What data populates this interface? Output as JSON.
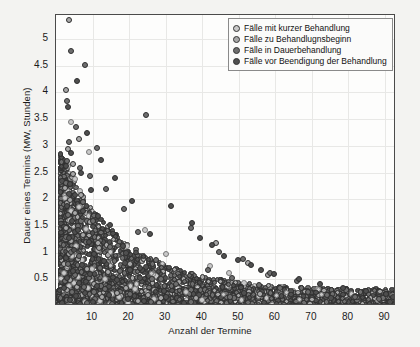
{
  "chart_data": {
    "type": "scatter",
    "title": "",
    "xlabel": "Anzahl der Termine",
    "ylabel": "Dauer eines Termins (MW, Stunden)",
    "xlim": [
      0,
      93
    ],
    "ylim": [
      0,
      5.45
    ],
    "xticks": [
      10,
      20,
      30,
      40,
      50,
      60,
      70,
      80,
      90
    ],
    "xticklabels": [
      "10",
      "20",
      "30",
      "40",
      "50",
      "60",
      "70",
      "80",
      "90"
    ],
    "yticks": [
      0.5,
      1,
      1.5,
      2,
      2.5,
      3,
      3.5,
      4,
      4.5,
      5
    ],
    "yticklabels": [
      "0.5",
      "1",
      "1.5",
      "2",
      "2.5",
      "3",
      "3.5",
      "4",
      "4.5",
      "5"
    ],
    "grid": true,
    "legend_position": "upper right",
    "marker_colors": {
      "short": "#c9c9c9",
      "begin": "#a8a8a8",
      "ongoing": "#6e6e6e",
      "ending": "#4f4f4f"
    },
    "series": [
      {
        "name": "Fälle mit kurzer Behandlung",
        "color": "#c9c9c9",
        "points": [
          [
            4.0,
            3.45
          ],
          [
            3.2,
            2.62
          ],
          [
            5.1,
            2.38
          ],
          [
            2.4,
            2.02
          ],
          [
            6.3,
            1.86
          ],
          [
            3.9,
            1.62
          ],
          [
            8.1,
            1.44
          ],
          [
            2.7,
            1.27
          ],
          [
            5.6,
            1.12
          ],
          [
            11.4,
            1.05
          ],
          [
            4.4,
            0.93
          ],
          [
            7.2,
            0.86
          ],
          [
            3.1,
            0.74
          ],
          [
            9.8,
            0.69
          ],
          [
            2.2,
            0.61
          ],
          [
            6.0,
            0.55
          ],
          [
            13.5,
            0.5
          ],
          [
            4.8,
            0.44
          ],
          [
            3.6,
            0.38
          ],
          [
            8.7,
            0.33
          ],
          [
            2.9,
            0.28
          ],
          [
            15.2,
            0.22
          ],
          [
            5.4,
            0.18
          ],
          [
            10.6,
            0.14
          ],
          [
            3.4,
            0.1
          ],
          [
            7.8,
            0.07
          ],
          [
            19.6,
            0.05
          ],
          [
            12.1,
            0.09
          ],
          [
            24.4,
            1.42
          ],
          [
            30.2,
            0.98
          ],
          [
            42.1,
            0.74
          ],
          [
            47.3,
            0.62
          ],
          [
            21.7,
            0.31
          ],
          [
            35.6,
            0.26
          ],
          [
            14.9,
            0.04
          ],
          [
            17.3,
            0.16
          ],
          [
            26.8,
            0.13
          ],
          [
            9.1,
            2.88
          ],
          [
            6.6,
            2.15
          ],
          [
            4.2,
            1.78
          ]
        ]
      },
      {
        "name": "Fälle zu Behandlugnsbeginn",
        "color": "#a8a8a8",
        "points": [
          [
            3.6,
            5.35
          ],
          [
            2.8,
            4.05
          ],
          [
            3.3,
            2.94
          ],
          [
            4.6,
            2.47
          ],
          [
            2.5,
            2.21
          ],
          [
            6.8,
            2.08
          ],
          [
            3.0,
            1.92
          ],
          [
            5.2,
            1.74
          ],
          [
            9.3,
            1.58
          ],
          [
            2.6,
            1.46
          ],
          [
            7.4,
            1.33
          ],
          [
            4.1,
            1.21
          ],
          [
            11.8,
            1.09
          ],
          [
            3.5,
            0.97
          ],
          [
            6.1,
            0.88
          ],
          [
            2.3,
            0.79
          ],
          [
            8.5,
            0.7
          ],
          [
            14.2,
            0.63
          ],
          [
            4.9,
            0.56
          ],
          [
            3.8,
            0.48
          ],
          [
            10.4,
            0.42
          ],
          [
            5.7,
            0.36
          ],
          [
            2.9,
            0.3
          ],
          [
            16.8,
            0.25
          ],
          [
            7.0,
            0.2
          ],
          [
            12.6,
            0.16
          ],
          [
            4.3,
            0.12
          ],
          [
            22.5,
            0.09
          ],
          [
            9.6,
            0.06
          ],
          [
            28.1,
            0.05
          ],
          [
            33.7,
            0.45
          ],
          [
            52.4,
            0.8
          ],
          [
            57.9,
            0.58
          ],
          [
            43.8,
            1.18
          ],
          [
            19.1,
            0.33
          ],
          [
            25.3,
            0.21
          ],
          [
            38.2,
            0.15
          ],
          [
            6.4,
            3.12
          ],
          [
            4.7,
            2.66
          ],
          [
            3.9,
            1.99
          ]
        ]
      },
      {
        "name": "Fälle in Dauerbehandlung",
        "color": "#6e6e6e",
        "points": [
          [
            4.2,
            4.78
          ],
          [
            7.9,
            4.52
          ],
          [
            2.9,
            3.84
          ],
          [
            5.4,
            3.36
          ],
          [
            3.6,
            3.08
          ],
          [
            11.2,
            2.96
          ],
          [
            24.6,
            3.58
          ],
          [
            3.1,
            2.72
          ],
          [
            6.7,
            2.58
          ],
          [
            9.4,
            2.44
          ],
          [
            2.6,
            2.31
          ],
          [
            13.8,
            2.19
          ],
          [
            4.8,
            2.06
          ],
          [
            7.3,
            1.94
          ],
          [
            18.5,
            1.82
          ],
          [
            3.4,
            1.71
          ],
          [
            10.1,
            1.6
          ],
          [
            5.9,
            1.49
          ],
          [
            22.3,
            1.39
          ],
          [
            2.8,
            1.29
          ],
          [
            8.2,
            1.2
          ],
          [
            14.7,
            1.11
          ],
          [
            4.1,
            1.02
          ],
          [
            6.3,
            0.94
          ],
          [
            27.4,
            0.86
          ],
          [
            3.2,
            0.79
          ],
          [
            11.9,
            0.72
          ],
          [
            17.6,
            0.65
          ],
          [
            5.1,
            0.58
          ],
          [
            9.0,
            0.52
          ],
          [
            2.4,
            0.46
          ],
          [
            32.8,
            0.41
          ],
          [
            7.6,
            0.36
          ],
          [
            13.4,
            0.31
          ],
          [
            4.5,
            0.26
          ],
          [
            20.2,
            0.22
          ],
          [
            6.0,
            0.18
          ],
          [
            10.8,
            0.14
          ],
          [
            3.0,
            0.11
          ],
          [
            26.1,
            0.08
          ],
          [
            8.4,
            0.06
          ],
          [
            15.3,
            0.04
          ],
          [
            41.5,
            0.68
          ],
          [
            48.2,
            0.52
          ],
          [
            55.6,
            0.4
          ],
          [
            61.3,
            0.33
          ],
          [
            68.9,
            0.27
          ],
          [
            74.2,
            0.21
          ],
          [
            81.7,
            0.17
          ],
          [
            88.4,
            0.13
          ],
          [
            36.9,
            1.46
          ],
          [
            44.7,
            1.02
          ],
          [
            51.1,
            0.88
          ],
          [
            58.5,
            0.62
          ],
          [
            65.8,
            0.46
          ]
        ]
      },
      {
        "name": "Fälle vor Beendigung der Behandlung",
        "color": "#4f4f4f",
        "points": [
          [
            5.8,
            4.22
          ],
          [
            3.3,
            3.72
          ],
          [
            8.6,
            3.24
          ],
          [
            4.0,
            2.86
          ],
          [
            12.4,
            2.74
          ],
          [
            2.7,
            2.62
          ],
          [
            6.9,
            2.5
          ],
          [
            16.1,
            2.4
          ],
          [
            3.8,
            2.28
          ],
          [
            9.7,
            2.17
          ],
          [
            5.2,
            2.07
          ],
          [
            20.8,
            1.97
          ],
          [
            2.9,
            1.88
          ],
          [
            7.5,
            1.78
          ],
          [
            11.6,
            1.69
          ],
          [
            4.3,
            1.6
          ],
          [
            14.9,
            1.52
          ],
          [
            6.1,
            1.43
          ],
          [
            25.7,
            1.35
          ],
          [
            3.5,
            1.27
          ],
          [
            8.9,
            1.19
          ],
          [
            18.3,
            1.12
          ],
          [
            5.0,
            1.04
          ],
          [
            10.5,
            0.97
          ],
          [
            2.6,
            0.9
          ],
          [
            13.2,
            0.84
          ],
          [
            7.1,
            0.77
          ],
          [
            22.9,
            0.71
          ],
          [
            4.6,
            0.65
          ],
          [
            9.3,
            0.59
          ],
          [
            3.1,
            0.53
          ],
          [
            16.7,
            0.48
          ],
          [
            6.4,
            0.43
          ],
          [
            11.1,
            0.38
          ],
          [
            2.3,
            0.33
          ],
          [
            29.6,
            0.29
          ],
          [
            8.0,
            0.25
          ],
          [
            14.4,
            0.21
          ],
          [
            5.5,
            0.18
          ],
          [
            19.8,
            0.14
          ],
          [
            3.7,
            0.11
          ],
          [
            24.2,
            0.09
          ],
          [
            10.0,
            0.07
          ],
          [
            35.1,
            0.05
          ],
          [
            6.7,
            0.03
          ],
          [
            39.4,
            1.28
          ],
          [
            45.9,
            0.94
          ],
          [
            53.3,
            0.76
          ],
          [
            59.7,
            0.6
          ],
          [
            66.4,
            0.5
          ],
          [
            72.1,
            0.42
          ],
          [
            78.6,
            0.34
          ],
          [
            84.9,
            0.28
          ],
          [
            90.3,
            0.22
          ],
          [
            92.1,
            0.16
          ],
          [
            31.5,
            1.88
          ],
          [
            37.2,
            1.56
          ],
          [
            42.6,
            1.14
          ],
          [
            49.8,
            0.86
          ],
          [
            56.2,
            0.68
          ]
        ]
      }
    ]
  },
  "legend": {
    "items": [
      {
        "label": "Fälle mit kurzer Behandlung",
        "color": "#c9c9c9"
      },
      {
        "label": "Fälle zu Behandlugnsbeginn",
        "color": "#a8a8a8"
      },
      {
        "label": "Fälle in Dauerbehandlung",
        "color": "#6e6e6e"
      },
      {
        "label": "Fälle vor Beendigung der Behandlung",
        "color": "#4f4f4f"
      }
    ]
  }
}
